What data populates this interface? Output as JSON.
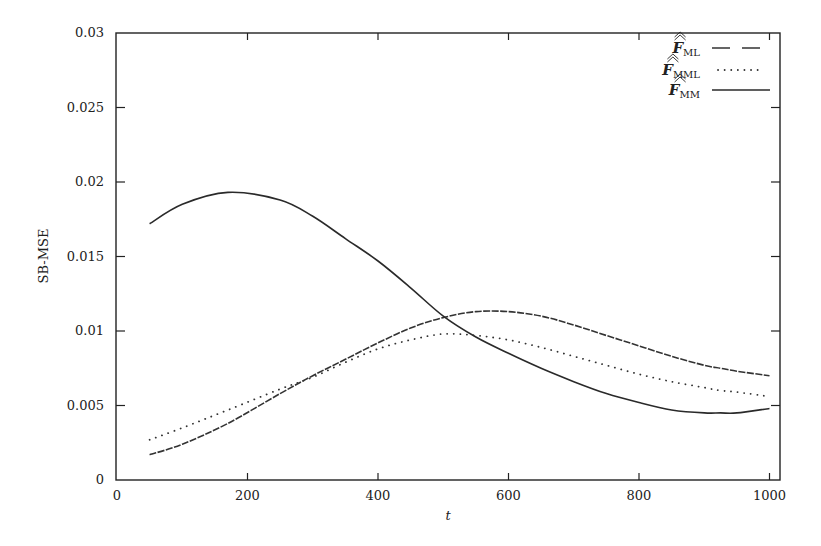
{
  "chart_data": {
    "type": "line",
    "title": "",
    "xlabel": "t",
    "ylabel": "SB-MSE",
    "xlim": [
      0,
      1017
    ],
    "ylim": [
      0,
      0.03
    ],
    "grid": false,
    "legend_position": "top-right",
    "x_ticks": [
      "0",
      "200",
      "400",
      "600",
      "800",
      "1000"
    ],
    "y_ticks": [
      "0",
      "0.005",
      "0.01",
      "0.015",
      "0.02",
      "0.025",
      "0.03"
    ],
    "x": [
      50,
      100,
      170,
      250,
      300,
      350,
      400,
      450,
      500,
      550,
      600,
      650,
      700,
      750,
      800,
      850,
      900,
      925,
      950,
      1000
    ],
    "series": [
      {
        "name": "F_ML",
        "legend_base": "F",
        "legend_sub": "ML",
        "style": "dashed",
        "values": [
          0.0017,
          0.0024,
          0.0038,
          0.0058,
          0.007,
          0.0081,
          0.0092,
          0.0102,
          0.0109,
          0.0113,
          0.0113,
          0.011,
          0.0104,
          0.0097,
          0.009,
          0.0083,
          0.0077,
          0.0075,
          0.0073,
          0.007
        ]
      },
      {
        "name": "F_MML",
        "legend_base": "F",
        "legend_sub": "MML",
        "style": "dotted",
        "values": [
          0.0027,
          0.0035,
          0.0047,
          0.0061,
          0.0069,
          0.0079,
          0.0088,
          0.0094,
          0.0098,
          0.0097,
          0.0094,
          0.0089,
          0.0083,
          0.0077,
          0.0071,
          0.0066,
          0.0062,
          0.006,
          0.0059,
          0.0056
        ]
      },
      {
        "name": "F_MM",
        "legend_base": "F",
        "legend_sub": "MM",
        "style": "solid",
        "values": [
          0.0172,
          0.0185,
          0.0193,
          0.0188,
          0.0177,
          0.0162,
          0.0147,
          0.0129,
          0.011,
          0.0096,
          0.0085,
          0.0075,
          0.0066,
          0.0058,
          0.0052,
          0.0047,
          0.0045,
          0.0045,
          0.0045,
          0.0048
        ]
      }
    ]
  }
}
